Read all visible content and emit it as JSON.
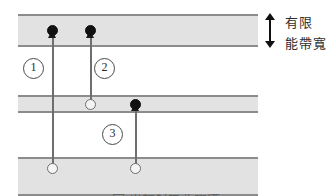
{
  "figure": {
    "type": "energy-band-transition-diagram",
    "caption": "圖 光輻射吸收躍遷",
    "background_color": "#ffffff",
    "band_fill_color": "#e2e2e2",
    "band_edge_color": "#8c8c8c"
  },
  "bands": [
    {
      "id": "top",
      "name": "upper-band",
      "x": 18,
      "y": 14,
      "width": 240,
      "height": 33
    },
    {
      "id": "middle",
      "name": "middle-band",
      "x": 18,
      "y": 95,
      "width": 240,
      "height": 18
    },
    {
      "id": "bottom",
      "name": "lower-band",
      "x": 18,
      "y": 157,
      "width": 240,
      "height": 39
    }
  ],
  "carriers": [
    {
      "id": "c1",
      "kind": "electron",
      "fill": "filled",
      "x": 47,
      "y": 25,
      "band": "top"
    },
    {
      "id": "c2",
      "kind": "electron",
      "fill": "filled",
      "x": 85,
      "y": 25,
      "band": "top"
    },
    {
      "id": "c3",
      "kind": "hole",
      "fill": "open",
      "x": 85,
      "y": 99,
      "band": "middle"
    },
    {
      "id": "c4",
      "kind": "electron",
      "fill": "filled",
      "x": 130,
      "y": 99,
      "band": "middle"
    },
    {
      "id": "c5",
      "kind": "hole",
      "fill": "open",
      "x": 47,
      "y": 163,
      "band": "bottom"
    },
    {
      "id": "c6",
      "kind": "hole",
      "fill": "open",
      "x": 130,
      "y": 163,
      "band": "bottom"
    }
  ],
  "transitions": [
    {
      "id": "t1",
      "label": "1",
      "from_band": "bottom",
      "to_band": "top",
      "x": 52,
      "top_y": 33,
      "bottom_y": 168,
      "label_x": 23,
      "label_y": 58
    },
    {
      "id": "t2",
      "label": "2",
      "from_band": "middle",
      "to_band": "top",
      "x": 90,
      "top_y": 33,
      "bottom_y": 104,
      "label_x": 94,
      "label_y": 58
    },
    {
      "id": "t3",
      "label": "3",
      "from_band": "bottom",
      "to_band": "middle",
      "x": 135,
      "top_y": 106,
      "bottom_y": 168,
      "label_x": 102,
      "label_y": 124
    }
  ],
  "bandwidth_annotation": {
    "icon": "double-arrow-vertical-icon",
    "line1": "有限",
    "line2": "能帶寬",
    "arrow_color": "#111111",
    "text_color": "#2e2e2e"
  }
}
